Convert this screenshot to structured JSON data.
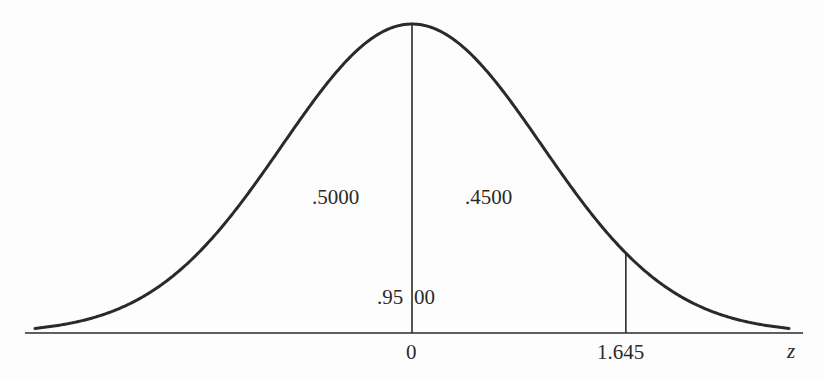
{
  "chart_data": {
    "type": "line",
    "title": "",
    "xlabel": "z",
    "ylabel": "",
    "x_ticks": [
      "0",
      "1.645"
    ],
    "xlim": [
      -2.9,
      2.9
    ],
    "series": [
      {
        "name": "standard normal density",
        "function": "exp(-z^2/2)/sqrt(2*pi)"
      }
    ],
    "vertical_lines": [
      {
        "z": 0,
        "label": "0"
      },
      {
        "z": 1.645,
        "label": "1.645"
      }
    ],
    "area_annotations": [
      {
        "region": "z < 0",
        "value": ".5000"
      },
      {
        "region": "0 < z < 1.645",
        "value": ".4500"
      },
      {
        "region": "z < 1.645 (total)",
        "value": ".9500",
        "display_parts": [
          ".95",
          "00"
        ]
      }
    ],
    "grid": false,
    "legend": null
  },
  "labels": {
    "left_area": ".5000",
    "right_area": ".4500",
    "total_area_left_part": ".95",
    "total_area_right_part": "00",
    "tick_zero": "0",
    "tick_critical": "1.645",
    "axis_variable": "z"
  },
  "colors": {
    "ink": "#2a2a2a",
    "background": "#fdfdfd"
  }
}
